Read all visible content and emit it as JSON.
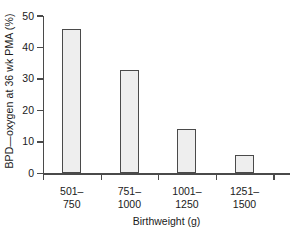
{
  "chart_data": {
    "type": "bar",
    "title": "",
    "categories": [
      "501–\n750",
      "751–\n1000",
      "1001–\n1250",
      "1251–\n1500"
    ],
    "category_lines": [
      [
        "501–",
        "750"
      ],
      [
        "751–",
        "1000"
      ],
      [
        "1001–",
        "1250"
      ],
      [
        "1251–",
        "1500"
      ]
    ],
    "values": [
      46,
      33,
      14,
      6
    ],
    "xlabel": "Birthweight (g)",
    "ylabel": "BPD—oxygen at 36 wk PMA (%)",
    "ylim": [
      0,
      50
    ],
    "yticks": [
      0,
      10,
      20,
      30,
      40,
      50
    ],
    "ytick_labels": [
      "0",
      "10",
      "20",
      "30",
      "40",
      "50"
    ],
    "grid": false,
    "legend": null,
    "bar_fill_color": "#eeeeee",
    "bar_edge_color": "#4a4a4a",
    "axis_color": "#4a4a4a",
    "background_color": "#ffffff"
  }
}
